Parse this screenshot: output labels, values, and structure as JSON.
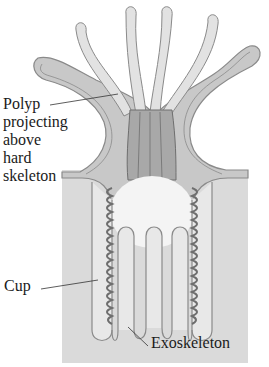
{
  "figure": {
    "colors": {
      "background": "#ffffff",
      "exoskeleton": "#dadada",
      "polyp_tissue": "#c8c8c8",
      "tentacle": "#e2e2e2",
      "outline": "#8a8a8a",
      "dark_tissue": "#6e6e6e",
      "cavity": "#f4f4f4"
    }
  },
  "labels": {
    "polyp": [
      "Polyp",
      "projecting",
      "above",
      "hard",
      "skeleton"
    ],
    "cup": "Cup",
    "exoskeleton": "Exoskeleton"
  }
}
